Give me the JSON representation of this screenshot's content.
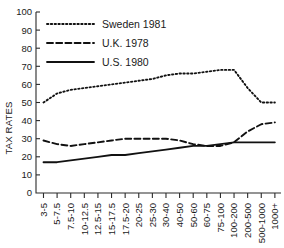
{
  "chart_data": {
    "type": "line",
    "title": "",
    "xlabel": "",
    "ylabel": "TAX RATES",
    "ylim": [
      0,
      100
    ],
    "yticks": [
      10,
      20,
      30,
      40,
      50,
      60,
      70,
      80,
      90,
      100
    ],
    "grid": false,
    "legend_position": "top-left",
    "categories": [
      "3-5",
      "5-7.5",
      "7.5-10",
      "10-12.5",
      "12.5-15",
      "15-17.5",
      "17.5-20",
      "20-25",
      "25-30",
      "30-40",
      "40-50",
      "50-60",
      "60-75",
      "75-100",
      "100-200",
      "200-500",
      "500-1000",
      "1000+"
    ],
    "series": [
      {
        "name": "Sweden 1981",
        "style": "dotted",
        "values": [
          50,
          55,
          57,
          58,
          59,
          60,
          61,
          62,
          63,
          65,
          66,
          66,
          67,
          68,
          68,
          58,
          50,
          50
        ]
      },
      {
        "name": "U.K. 1978",
        "style": "dashed",
        "values": [
          29,
          27,
          26,
          27,
          28,
          29,
          30,
          30,
          30,
          30,
          29,
          27,
          26,
          26,
          28,
          34,
          38,
          39
        ]
      },
      {
        "name": "U.S. 1980",
        "style": "solid",
        "values": [
          17,
          17,
          18,
          19,
          20,
          21,
          21,
          22,
          23,
          24,
          25,
          26,
          26,
          27,
          28,
          28,
          28,
          28
        ]
      }
    ]
  },
  "legend": {
    "items": [
      {
        "label": "Sweden 1981",
        "style": "dotted"
      },
      {
        "label": "U.K. 1978",
        "style": "dashed"
      },
      {
        "label": "U.S. 1980",
        "style": "solid"
      }
    ]
  },
  "axes": {
    "y_title": "TAX RATES"
  },
  "colors": {
    "ink": "#111111",
    "axis": "#2b2b2b",
    "background": "#ffffff"
  }
}
